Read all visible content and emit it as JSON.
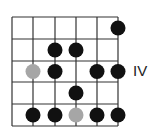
{
  "diagram": {
    "type": "guitar-scale-fretboard",
    "position_label": "IV",
    "grid": {
      "strings_x": [
        12,
        33,
        55,
        76,
        97,
        118
      ],
      "frets_y": [
        17,
        39,
        61,
        82,
        104,
        126
      ],
      "line_color": "#333333"
    },
    "colors": {
      "note": "#111111",
      "root": "#a6a6a6"
    },
    "notes": [
      {
        "string": 6,
        "fret": 1,
        "type": "note"
      },
      {
        "string": 3,
        "fret": 2,
        "type": "note"
      },
      {
        "string": 4,
        "fret": 2,
        "type": "note"
      },
      {
        "string": 2,
        "fret": 3,
        "type": "root"
      },
      {
        "string": 3,
        "fret": 3,
        "type": "note"
      },
      {
        "string": 5,
        "fret": 3,
        "type": "note"
      },
      {
        "string": 6,
        "fret": 3,
        "type": "note"
      },
      {
        "string": 4,
        "fret": 4,
        "type": "note"
      },
      {
        "string": 2,
        "fret": 5,
        "type": "note"
      },
      {
        "string": 3,
        "fret": 5,
        "type": "note"
      },
      {
        "string": 4,
        "fret": 5,
        "type": "root"
      },
      {
        "string": 5,
        "fret": 5,
        "type": "note"
      },
      {
        "string": 6,
        "fret": 5,
        "type": "note"
      }
    ]
  }
}
